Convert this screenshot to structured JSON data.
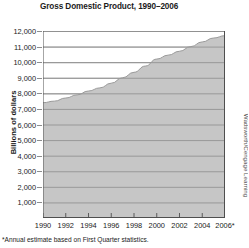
{
  "chart_data": {
    "type": "area",
    "title": "Gross Domestic Product, 1990–2006",
    "xlabel": "",
    "ylabel": "Billions of dollars",
    "ylim": [
      0,
      12000
    ],
    "xlim": [
      1990,
      2006
    ],
    "grid": true,
    "legend": null,
    "footnote": "*Annual estimate based on First Quarter statistics.",
    "credit": "Wadsworth/Cengage Learning",
    "ytick_labels": [
      "12,000",
      "11,000",
      "10,000",
      "9,000",
      "8,000",
      "7,000",
      "6,000",
      "5,000",
      "4,000",
      "3,000",
      "2,000",
      "1,000"
    ],
    "ytick_values": [
      12000,
      11000,
      10000,
      9000,
      8000,
      7000,
      6000,
      5000,
      4000,
      3000,
      2000,
      1000
    ],
    "xtick_labels": [
      "1990",
      "1992",
      "1994",
      "1996",
      "1998",
      "2000",
      "2002",
      "2004",
      "2006*"
    ],
    "xtick_values": [
      1990,
      1992,
      1994,
      1996,
      1998,
      2000,
      2002,
      2004,
      2006
    ],
    "x": [
      1990,
      1991,
      1992,
      1993,
      1994,
      1995,
      1996,
      1997,
      1998,
      1999,
      2000,
      2001,
      2002,
      2003,
      2004,
      2005,
      2006
    ],
    "values": [
      7400,
      7500,
      7700,
      7900,
      8150,
      8350,
      8650,
      9000,
      9350,
      9750,
      10200,
      10450,
      10700,
      11000,
      11300,
      11550,
      11700
    ],
    "series": [
      {
        "name": "Gross Domestic Product",
        "values": [
          7400,
          7500,
          7700,
          7900,
          8150,
          8350,
          8650,
          9000,
          9350,
          9750,
          10200,
          10450,
          10700,
          11000,
          11300,
          11550,
          11700
        ]
      }
    ],
    "colors": {
      "area_fill": "#c6c6c6",
      "gridline": "#8d8d8d",
      "axis": "#4f4f4f",
      "text": "#1b1b1b"
    }
  }
}
